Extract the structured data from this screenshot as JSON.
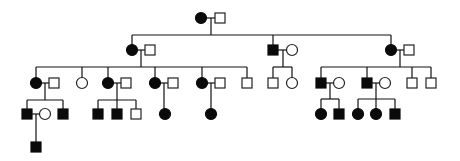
{
  "diagram": {
    "type": "pedigree",
    "generations": 5,
    "symbol_size": 10,
    "colors": {
      "affected": "#0a0a0a",
      "unaffected": "#ffffff",
      "line": "#111111"
    }
  },
  "individuals": [
    {
      "id": "I-1",
      "gen": 1,
      "sex": "female",
      "affected": true,
      "x": 201,
      "y": 18
    },
    {
      "id": "I-2",
      "gen": 1,
      "sex": "male",
      "affected": false,
      "x": 220,
      "y": 18
    },
    {
      "id": "II-1",
      "gen": 2,
      "sex": "female",
      "affected": true,
      "x": 132,
      "y": 50
    },
    {
      "id": "II-2",
      "gen": 2,
      "sex": "male",
      "affected": false,
      "x": 150,
      "y": 50
    },
    {
      "id": "II-3",
      "gen": 2,
      "sex": "male",
      "affected": true,
      "x": 273,
      "y": 50
    },
    {
      "id": "II-4",
      "gen": 2,
      "sex": "female",
      "affected": false,
      "x": 292,
      "y": 50
    },
    {
      "id": "II-5",
      "gen": 2,
      "sex": "female",
      "affected": true,
      "x": 391,
      "y": 50
    },
    {
      "id": "II-6",
      "gen": 2,
      "sex": "male",
      "affected": false,
      "x": 409,
      "y": 50
    },
    {
      "id": "III-1",
      "gen": 3,
      "sex": "female",
      "affected": true,
      "x": 36,
      "y": 83
    },
    {
      "id": "III-2",
      "gen": 3,
      "sex": "male",
      "affected": false,
      "x": 54,
      "y": 83
    },
    {
      "id": "III-3",
      "gen": 3,
      "sex": "female",
      "affected": false,
      "x": 82,
      "y": 83
    },
    {
      "id": "III-4",
      "gen": 3,
      "sex": "female",
      "affected": true,
      "x": 108,
      "y": 83
    },
    {
      "id": "III-5",
      "gen": 3,
      "sex": "male",
      "affected": false,
      "x": 126,
      "y": 83
    },
    {
      "id": "III-6",
      "gen": 3,
      "sex": "female",
      "affected": true,
      "x": 155,
      "y": 83
    },
    {
      "id": "III-7",
      "gen": 3,
      "sex": "male",
      "affected": false,
      "x": 173,
      "y": 83
    },
    {
      "id": "III-8",
      "gen": 3,
      "sex": "female",
      "affected": true,
      "x": 202,
      "y": 83
    },
    {
      "id": "III-9",
      "gen": 3,
      "sex": "male",
      "affected": false,
      "x": 220,
      "y": 83
    },
    {
      "id": "III-10",
      "gen": 3,
      "sex": "male",
      "affected": false,
      "x": 247,
      "y": 83
    },
    {
      "id": "III-11",
      "gen": 3,
      "sex": "male",
      "affected": false,
      "x": 273,
      "y": 83
    },
    {
      "id": "III-12",
      "gen": 3,
      "sex": "female",
      "affected": false,
      "x": 292,
      "y": 83
    },
    {
      "id": "III-13",
      "gen": 3,
      "sex": "male",
      "affected": true,
      "x": 321,
      "y": 83
    },
    {
      "id": "III-14",
      "gen": 3,
      "sex": "female",
      "affected": false,
      "x": 339,
      "y": 83
    },
    {
      "id": "III-15",
      "gen": 3,
      "sex": "male",
      "affected": true,
      "x": 367,
      "y": 83
    },
    {
      "id": "III-16",
      "gen": 3,
      "sex": "female",
      "affected": false,
      "x": 385,
      "y": 83
    },
    {
      "id": "III-17",
      "gen": 3,
      "sex": "male",
      "affected": false,
      "x": 412,
      "y": 83
    },
    {
      "id": "III-18",
      "gen": 3,
      "sex": "male",
      "affected": false,
      "x": 431,
      "y": 83
    },
    {
      "id": "IV-1",
      "gen": 4,
      "sex": "male",
      "affected": true,
      "x": 27,
      "y": 114
    },
    {
      "id": "IV-2",
      "gen": 4,
      "sex": "female",
      "affected": false,
      "x": 45,
      "y": 114
    },
    {
      "id": "IV-3",
      "gen": 4,
      "sex": "male",
      "affected": true,
      "x": 63,
      "y": 114
    },
    {
      "id": "IV-4",
      "gen": 4,
      "sex": "male",
      "affected": true,
      "x": 98,
      "y": 114
    },
    {
      "id": "IV-5",
      "gen": 4,
      "sex": "male",
      "affected": true,
      "x": 117,
      "y": 114
    },
    {
      "id": "IV-6",
      "gen": 4,
      "sex": "male",
      "affected": false,
      "x": 136,
      "y": 114
    },
    {
      "id": "IV-7",
      "gen": 4,
      "sex": "female",
      "affected": true,
      "x": 165,
      "y": 114
    },
    {
      "id": "IV-8",
      "gen": 4,
      "sex": "female",
      "affected": true,
      "x": 211,
      "y": 114
    },
    {
      "id": "IV-9",
      "gen": 4,
      "sex": "female",
      "affected": true,
      "x": 321,
      "y": 114
    },
    {
      "id": "IV-10",
      "gen": 4,
      "sex": "male",
      "affected": true,
      "x": 339,
      "y": 114
    },
    {
      "id": "IV-11",
      "gen": 4,
      "sex": "female",
      "affected": true,
      "x": 358,
      "y": 114
    },
    {
      "id": "IV-12",
      "gen": 4,
      "sex": "female",
      "affected": true,
      "x": 376,
      "y": 114
    },
    {
      "id": "IV-13",
      "gen": 4,
      "sex": "male",
      "affected": true,
      "x": 395,
      "y": 114
    },
    {
      "id": "V-1",
      "gen": 5,
      "sex": "male",
      "affected": true,
      "x": 36,
      "y": 147
    }
  ],
  "lines": [
    {
      "name": "couple-I",
      "x1": 207,
      "y1": 18,
      "x2": 215,
      "y2": 18
    },
    {
      "name": "descent-I",
      "x1": 211,
      "y1": 18,
      "x2": 211,
      "y2": 35
    },
    {
      "name": "sibship-II",
      "x1": 132,
      "y1": 35,
      "x2": 391,
      "y2": 35
    },
    {
      "name": "drop-II-1",
      "x1": 132,
      "y1": 35,
      "x2": 132,
      "y2": 45
    },
    {
      "name": "drop-II-3",
      "x1": 273,
      "y1": 35,
      "x2": 273,
      "y2": 45
    },
    {
      "name": "drop-II-5",
      "x1": 391,
      "y1": 35,
      "x2": 391,
      "y2": 45
    },
    {
      "name": "couple-II-1",
      "x1": 137,
      "y1": 50,
      "x2": 145,
      "y2": 50
    },
    {
      "name": "descent-II-1",
      "x1": 141,
      "y1": 50,
      "x2": 141,
      "y2": 67
    },
    {
      "name": "sibship-III-a",
      "x1": 36,
      "y1": 67,
      "x2": 247,
      "y2": 67
    },
    {
      "name": "drop-III-1",
      "x1": 36,
      "y1": 67,
      "x2": 36,
      "y2": 78
    },
    {
      "name": "drop-III-3",
      "x1": 82,
      "y1": 67,
      "x2": 82,
      "y2": 78
    },
    {
      "name": "drop-III-4",
      "x1": 108,
      "y1": 67,
      "x2": 108,
      "y2": 78
    },
    {
      "name": "drop-III-6",
      "x1": 155,
      "y1": 67,
      "x2": 155,
      "y2": 78
    },
    {
      "name": "drop-III-8",
      "x1": 202,
      "y1": 67,
      "x2": 202,
      "y2": 78
    },
    {
      "name": "drop-III-10",
      "x1": 247,
      "y1": 67,
      "x2": 247,
      "y2": 78
    },
    {
      "name": "couple-II-3",
      "x1": 278,
      "y1": 50,
      "x2": 287,
      "y2": 50
    },
    {
      "name": "descent-II-3",
      "x1": 283,
      "y1": 50,
      "x2": 283,
      "y2": 67
    },
    {
      "name": "sibship-III-b",
      "x1": 273,
      "y1": 67,
      "x2": 292,
      "y2": 67
    },
    {
      "name": "drop-III-11",
      "x1": 273,
      "y1": 67,
      "x2": 273,
      "y2": 78
    },
    {
      "name": "drop-III-12",
      "x1": 292,
      "y1": 67,
      "x2": 292,
      "y2": 78
    },
    {
      "name": "couple-II-5",
      "x1": 396,
      "y1": 50,
      "x2": 404,
      "y2": 50
    },
    {
      "name": "descent-II-5",
      "x1": 400,
      "y1": 50,
      "x2": 400,
      "y2": 67
    },
    {
      "name": "sibship-III-c",
      "x1": 321,
      "y1": 67,
      "x2": 431,
      "y2": 67
    },
    {
      "name": "drop-III-13",
      "x1": 321,
      "y1": 67,
      "x2": 321,
      "y2": 78
    },
    {
      "name": "drop-III-15",
      "x1": 367,
      "y1": 67,
      "x2": 367,
      "y2": 78
    },
    {
      "name": "drop-III-17",
      "x1": 412,
      "y1": 67,
      "x2": 412,
      "y2": 78
    },
    {
      "name": "drop-III-18",
      "x1": 431,
      "y1": 67,
      "x2": 431,
      "y2": 78
    },
    {
      "name": "couple-III-1",
      "x1": 41,
      "y1": 83,
      "x2": 49,
      "y2": 83
    },
    {
      "name": "descent-III-1",
      "x1": 45,
      "y1": 83,
      "x2": 45,
      "y2": 100
    },
    {
      "name": "sibship-IV-a",
      "x1": 27,
      "y1": 100,
      "x2": 63,
      "y2": 100
    },
    {
      "name": "drop-IV-1",
      "x1": 27,
      "y1": 100,
      "x2": 27,
      "y2": 109
    },
    {
      "name": "drop-IV-3",
      "x1": 63,
      "y1": 100,
      "x2": 63,
      "y2": 109
    },
    {
      "name": "couple-III-4",
      "x1": 113,
      "y1": 83,
      "x2": 121,
      "y2": 83
    },
    {
      "name": "descent-III-4",
      "x1": 117,
      "y1": 83,
      "x2": 117,
      "y2": 100
    },
    {
      "name": "sibship-IV-b",
      "x1": 98,
      "y1": 100,
      "x2": 136,
      "y2": 100
    },
    {
      "name": "drop-IV-4",
      "x1": 98,
      "y1": 100,
      "x2": 98,
      "y2": 109
    },
    {
      "name": "drop-IV-5",
      "x1": 117,
      "y1": 100,
      "x2": 117,
      "y2": 109
    },
    {
      "name": "drop-IV-6",
      "x1": 136,
      "y1": 100,
      "x2": 136,
      "y2": 109
    },
    {
      "name": "couple-III-6",
      "x1": 160,
      "y1": 83,
      "x2": 168,
      "y2": 83
    },
    {
      "name": "descent-III-6",
      "x1": 164,
      "y1": 83,
      "x2": 164,
      "y2": 109
    },
    {
      "name": "couple-III-8",
      "x1": 207,
      "y1": 83,
      "x2": 215,
      "y2": 83
    },
    {
      "name": "descent-III-8",
      "x1": 211,
      "y1": 83,
      "x2": 211,
      "y2": 109
    },
    {
      "name": "couple-III-13",
      "x1": 326,
      "y1": 83,
      "x2": 334,
      "y2": 83
    },
    {
      "name": "descent-III-13",
      "x1": 330,
      "y1": 83,
      "x2": 330,
      "y2": 99
    },
    {
      "name": "sibship-IV-c",
      "x1": 321,
      "y1": 99,
      "x2": 339,
      "y2": 99
    },
    {
      "name": "drop-IV-9",
      "x1": 321,
      "y1": 99,
      "x2": 321,
      "y2": 109
    },
    {
      "name": "drop-IV-10",
      "x1": 339,
      "y1": 99,
      "x2": 339,
      "y2": 109
    },
    {
      "name": "couple-III-15",
      "x1": 372,
      "y1": 83,
      "x2": 380,
      "y2": 83
    },
    {
      "name": "descent-III-15",
      "x1": 376,
      "y1": 83,
      "x2": 376,
      "y2": 99
    },
    {
      "name": "sibship-IV-d",
      "x1": 358,
      "y1": 99,
      "x2": 395,
      "y2": 99
    },
    {
      "name": "drop-IV-11",
      "x1": 358,
      "y1": 99,
      "x2": 358,
      "y2": 109
    },
    {
      "name": "drop-IV-12",
      "x1": 376,
      "y1": 99,
      "x2": 376,
      "y2": 109
    },
    {
      "name": "drop-IV-13",
      "x1": 395,
      "y1": 99,
      "x2": 395,
      "y2": 109
    },
    {
      "name": "couple-IV-1",
      "x1": 32,
      "y1": 114,
      "x2": 40,
      "y2": 114
    },
    {
      "name": "descent-IV-1",
      "x1": 36,
      "y1": 114,
      "x2": 36,
      "y2": 142
    }
  ]
}
